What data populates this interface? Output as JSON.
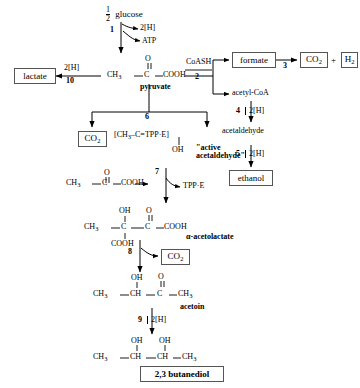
{
  "diagram": {
    "type": "biochemical-pathway"
  },
  "nodes": {
    "glucose": "glucose",
    "glucose_coefficient_numerator": "1",
    "glucose_coefficient_denominator": "2",
    "two_h_top": "2[H]",
    "atp": "ATP",
    "lactate": "lactate",
    "two_h_lactate": "2[H]",
    "pyruvate_name": "pyruvate",
    "pyruvate_ch3": "CH",
    "pyruvate_ch3_sub": "3",
    "pyruvate_o": "O",
    "pyruvate_dbl": "||",
    "pyruvate_c": "C",
    "pyruvate_cooh": "COOH",
    "coash": "CoASH",
    "formate": "formate",
    "co2_right": "CO",
    "co2_right_sub": "2",
    "plus": "+",
    "h2": "H",
    "h2_sub": "2",
    "acetyl_coa": "acetyl-CoA",
    "two_h_step4": "2[H]",
    "acetaldehyde": "acetaldehyde",
    "two_h_step5": "2[H]",
    "ethanol": "ethanol",
    "co2_left": "CO",
    "co2_left_sub": "2",
    "active_complex": "[CH",
    "active_complex_sub": "3",
    "active_complex_rest": "–C=TPP·E]",
    "active_oh": "OH",
    "active_label_line1": "\"active",
    "active_label_line2": "acetaldehyde\"",
    "tpp_e": "TPP·E",
    "pyruvate2_ch3": "CH",
    "pyruvate2_ch3_sub": "3",
    "pyruvate2_o": "O",
    "pyruvate2_c": "C",
    "pyruvate2_cooh": "COOH",
    "acetolactate_oh": "OH",
    "acetolactate_o": "O",
    "acetolactate_ch3": "CH",
    "acetolactate_ch3_sub": "3",
    "acetolactate_c1": "C",
    "acetolactate_c2": "C",
    "acetolactate_cooh_right": "COOH",
    "acetolactate_cooh_bottom": "COOH",
    "acetolactate_name": "α-acetolactate",
    "co2_acetoin": "CO",
    "co2_acetoin_sub": "2",
    "acetoin_oh": "OH",
    "acetoin_o": "O",
    "acetoin_ch3_left": "CH",
    "acetoin_ch3_left_sub": "3",
    "acetoin_ch": "CH",
    "acetoin_c": "C",
    "acetoin_ch3_right": "CH",
    "acetoin_ch3_right_sub": "3",
    "acetoin_name": "acetoin",
    "two_h_step9": "2[H]",
    "butanediol_oh_left": "OH",
    "butanediol_oh_right": "OH",
    "butanediol_ch3_left": "CH",
    "butanediol_ch3_left_sub": "3",
    "butanediol_ch_left": "CH",
    "butanediol_ch_right": "CH",
    "butanediol_ch3_right": "CH",
    "butanediol_ch3_right_sub": "3",
    "butanediol_name": "2,3  butanediol"
  },
  "step_numbers": {
    "s1": "1",
    "s2": "2",
    "s3": "3",
    "s4": "4",
    "s5": "5",
    "s6": "6",
    "s7": "7",
    "s8": "8",
    "s9": "9",
    "s10": "10"
  },
  "colors": {
    "stroke": "#000000",
    "box_border": "#555555",
    "background": "#ffffff"
  }
}
